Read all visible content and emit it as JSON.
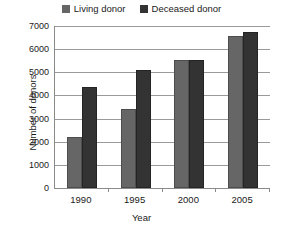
{
  "chart_data": {
    "type": "bar",
    "title": "",
    "xlabel": "Year",
    "ylabel": "Number of donors",
    "categories": [
      "1990",
      "1995",
      "2000",
      "2005"
    ],
    "series": [
      {
        "name": "Living donor",
        "values": [
          2120,
          3330,
          5450,
          6500
        ],
        "color": "#666666"
      },
      {
        "name": "Deceased donor",
        "values": [
          4290,
          5000,
          5450,
          6670
        ],
        "color": "#333333"
      }
    ],
    "ylim": [
      0,
      7000
    ],
    "yticks": [
      0,
      1000,
      2000,
      3000,
      4000,
      5000,
      6000,
      7000
    ],
    "ytick_labels": [
      "0",
      "1000",
      "2000",
      "3000",
      "4000",
      "5000",
      "6000",
      "7000"
    ],
    "grid": true,
    "grid_axis": "y",
    "legend_position": "top-center"
  },
  "legend": {
    "entries": [
      {
        "label": "Living donor"
      },
      {
        "label": "Deceased donor"
      }
    ]
  },
  "axes": {
    "y_title": "Number of donors",
    "x_title": "Year"
  }
}
